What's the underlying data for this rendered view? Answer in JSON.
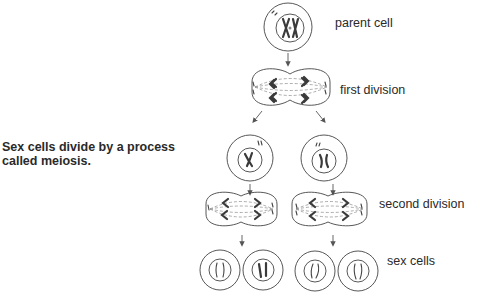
{
  "caption": {
    "text": "Sex cells divide by a process called meiosis."
  },
  "labels": {
    "parent_cell": "parent cell",
    "first_division": "first division",
    "second_division": "second division",
    "sex_cells": "sex cells"
  },
  "diagram": {
    "stages": [
      {
        "name": "parent cell",
        "cell_count": 1
      },
      {
        "name": "first division",
        "cell_count": 1
      },
      {
        "name": "intermediate cells",
        "cell_count": 2
      },
      {
        "name": "second division",
        "cell_count": 2
      },
      {
        "name": "sex cells",
        "cell_count": 4
      }
    ],
    "colors": {
      "outline": "#444444",
      "chromosome": "#3a3a3a",
      "spindle": "#8a8a8a",
      "text": "#2a2a2a"
    }
  }
}
